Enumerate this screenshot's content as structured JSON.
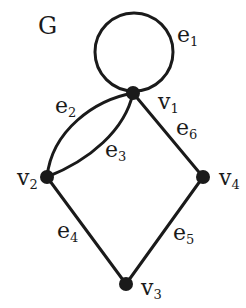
{
  "graph": {
    "name": "G",
    "vertices": [
      {
        "id": "v1",
        "label": "v",
        "sub": "1"
      },
      {
        "id": "v2",
        "label": "v",
        "sub": "2"
      },
      {
        "id": "v3",
        "label": "v",
        "sub": "3"
      },
      {
        "id": "v4",
        "label": "v",
        "sub": "4"
      }
    ],
    "edges": [
      {
        "id": "e1",
        "label": "e",
        "sub": "1",
        "from": "v1",
        "to": "v1",
        "type": "loop"
      },
      {
        "id": "e2",
        "label": "e",
        "sub": "2",
        "from": "v1",
        "to": "v2",
        "type": "curve-outer"
      },
      {
        "id": "e3",
        "label": "e",
        "sub": "3",
        "from": "v1",
        "to": "v2",
        "type": "curve-inner"
      },
      {
        "id": "e4",
        "label": "e",
        "sub": "4",
        "from": "v2",
        "to": "v3",
        "type": "line"
      },
      {
        "id": "e5",
        "label": "e",
        "sub": "5",
        "from": "v3",
        "to": "v4",
        "type": "line"
      },
      {
        "id": "e6",
        "label": "e",
        "sub": "6",
        "from": "v1",
        "to": "v4",
        "type": "line"
      }
    ],
    "colors": {
      "stroke": "#1a1a1a",
      "background": "#ffffff"
    }
  }
}
